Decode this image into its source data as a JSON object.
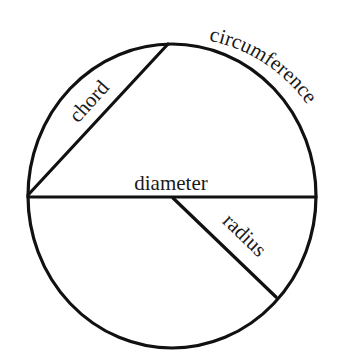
{
  "diagram": {
    "labels": {
      "circumference": "circumference",
      "chord": "chord",
      "diameter": "diameter",
      "radius": "radius"
    },
    "colors": {
      "stroke": "#111111",
      "text": "#1a1a1a",
      "background": "#ffffff"
    },
    "geometry": {
      "circle": {
        "cx": 172,
        "cy": 196,
        "rx": 144,
        "ry": 152
      },
      "diameter": {
        "x1": 28,
        "y1": 197,
        "x2": 316,
        "y2": 197
      },
      "chord": {
        "x1": 28,
        "y1": 195,
        "x2": 168,
        "y2": 44
      },
      "radius": {
        "x1": 173,
        "y1": 198,
        "x2": 276,
        "y2": 297
      }
    }
  }
}
